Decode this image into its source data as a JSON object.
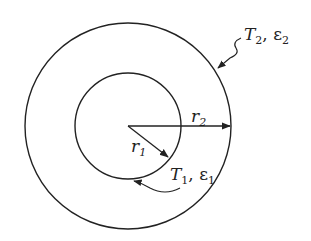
{
  "diagram": {
    "type": "concentric-spheres-radiation",
    "outer_circle": {
      "label_symbol": "T",
      "label_sub": "2",
      "emissivity_symbol": "ε",
      "emissivity_sub": "2",
      "separator": ", "
    },
    "inner_circle": {
      "label_symbol": "T",
      "label_sub": "1",
      "emissivity_symbol": "ε",
      "emissivity_sub": "1",
      "separator": ", "
    },
    "radius_outer": {
      "symbol": "r",
      "sub": "2"
    },
    "radius_inner": {
      "symbol": "r",
      "sub": "1"
    },
    "colors": {
      "stroke": "#222222",
      "background": "#ffffff"
    }
  }
}
